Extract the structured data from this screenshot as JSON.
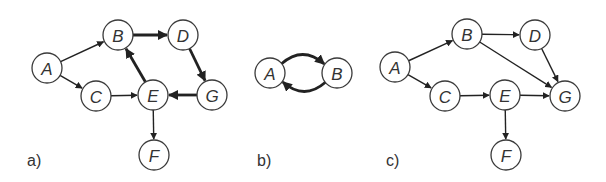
{
  "panels": [
    {
      "label": "a)",
      "label_pos": [
        27,
        166
      ],
      "nodes": [
        {
          "id": "A",
          "x": 47,
          "y": 68
        },
        {
          "id": "B",
          "x": 118,
          "y": 35
        },
        {
          "id": "C",
          "x": 96,
          "y": 96
        },
        {
          "id": "D",
          "x": 183,
          "y": 35
        },
        {
          "id": "E",
          "x": 153,
          "y": 95
        },
        {
          "id": "G",
          "x": 212,
          "y": 95
        },
        {
          "id": "F",
          "x": 154,
          "y": 155
        }
      ],
      "edges": [
        {
          "from": "A",
          "to": "B",
          "weight": "thin"
        },
        {
          "from": "A",
          "to": "C",
          "weight": "thin"
        },
        {
          "from": "C",
          "to": "E",
          "weight": "thin"
        },
        {
          "from": "B",
          "to": "D",
          "weight": "thick"
        },
        {
          "from": "D",
          "to": "G",
          "weight": "thick"
        },
        {
          "from": "G",
          "to": "E",
          "weight": "thick"
        },
        {
          "from": "E",
          "to": "B",
          "weight": "thick"
        },
        {
          "from": "E",
          "to": "F",
          "weight": "thin"
        }
      ]
    },
    {
      "label": "b)",
      "label_pos": [
        257,
        166
      ],
      "nodes": [
        {
          "id": "A",
          "x": 270,
          "y": 73
        },
        {
          "id": "B",
          "x": 337,
          "y": 73
        }
      ],
      "edges": [
        {
          "from": "A",
          "to": "B",
          "weight": "thick",
          "curve": "over"
        },
        {
          "from": "B",
          "to": "A",
          "weight": "thick",
          "curve": "under"
        }
      ]
    },
    {
      "label": "c)",
      "label_pos": [
        386,
        166
      ],
      "nodes": [
        {
          "id": "A",
          "x": 395,
          "y": 67
        },
        {
          "id": "B",
          "x": 467,
          "y": 34
        },
        {
          "id": "C",
          "x": 445,
          "y": 96
        },
        {
          "id": "D",
          "x": 535,
          "y": 35
        },
        {
          "id": "E",
          "x": 505,
          "y": 95
        },
        {
          "id": "G",
          "x": 565,
          "y": 96
        },
        {
          "id": "F",
          "x": 506,
          "y": 155
        }
      ],
      "edges": [
        {
          "from": "A",
          "to": "B",
          "weight": "thin"
        },
        {
          "from": "A",
          "to": "C",
          "weight": "thin"
        },
        {
          "from": "B",
          "to": "D",
          "weight": "thin"
        },
        {
          "from": "B",
          "to": "G",
          "weight": "thin"
        },
        {
          "from": "D",
          "to": "G",
          "weight": "thin"
        },
        {
          "from": "C",
          "to": "E",
          "weight": "thin"
        },
        {
          "from": "E",
          "to": "G",
          "weight": "thin"
        },
        {
          "from": "E",
          "to": "F",
          "weight": "thin"
        }
      ]
    }
  ],
  "style": {
    "node_radius": 15,
    "node_stroke": "#3a3a3a",
    "edge_color": "#222222",
    "background": "#ffffff"
  }
}
